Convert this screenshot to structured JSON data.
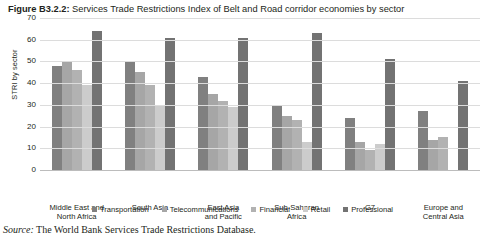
{
  "figure": {
    "number": "Figure B3.2.2:",
    "title": " Services Trade Restrictions Index of Belt and Road corridor economies by sector"
  },
  "source": {
    "label": "Source:",
    "text": " The World Bank Services Trade Restrictions Database."
  },
  "colors": {
    "transportation": "#808080",
    "telecommunications": "#a6a6a6",
    "financial": "#b2b2b2",
    "retail": "#cccccc",
    "professional": "#737373",
    "gridline": "#dcdcdc",
    "axis": "#bcbcbc",
    "text": "#231f20",
    "background": "#ffffff"
  },
  "chart_data": {
    "type": "bar",
    "title": "Services Trade Restrictions Index of Belt and Road corridor economies by sector",
    "xlabel": "",
    "ylabel": "STRI by sector",
    "ylim": [
      0,
      70
    ],
    "yticks": [
      0,
      10,
      20,
      30,
      40,
      50,
      60,
      70
    ],
    "ytick_labels": [
      "0",
      "10",
      "20",
      "30",
      "40",
      "50",
      "60",
      "70"
    ],
    "grid": true,
    "legend_position": "bottom",
    "categories": [
      "Middle East and\nNorth Africa",
      "South Asia",
      "East Asia\nand Pacific",
      "Sub-Saharan\nAfrica",
      "G7",
      "Europe and\nCentral Asia"
    ],
    "category_lines": [
      [
        "Middle East and",
        "North Africa"
      ],
      [
        "South Asia",
        ""
      ],
      [
        "East Asia",
        "and Pacific"
      ],
      [
        "Sub-Saharan",
        "Africa"
      ],
      [
        "G7",
        ""
      ],
      [
        "Europe and",
        "Central Asia"
      ]
    ],
    "series": [
      {
        "name": "Transportation",
        "color": "#808080",
        "values": [
          48,
          50,
          43,
          30,
          24,
          27
        ]
      },
      {
        "name": "Telecommunications",
        "color": "#a6a6a6",
        "values": [
          50,
          45,
          35,
          25,
          13,
          14
        ]
      },
      {
        "name": "Financial",
        "color": "#b2b2b2",
        "values": [
          46,
          39,
          32,
          23,
          9,
          15
        ]
      },
      {
        "name": "Retail",
        "color": "#cccccc",
        "values": [
          39,
          30,
          29,
          13,
          12,
          0
        ]
      },
      {
        "name": "Professional",
        "color": "#737373",
        "values": [
          64,
          61,
          61,
          63,
          51,
          41
        ]
      }
    ]
  }
}
